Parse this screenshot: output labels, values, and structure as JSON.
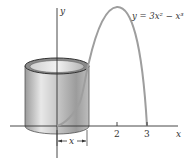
{
  "figure": {
    "equation_label": "y = 3x² − x³",
    "axis_y_label": "y",
    "axis_x_label": "x",
    "ticks": [
      "2",
      "3"
    ],
    "width_label": "x",
    "curve_color": "#9e9e9e",
    "axis_color": "#333333"
  }
}
